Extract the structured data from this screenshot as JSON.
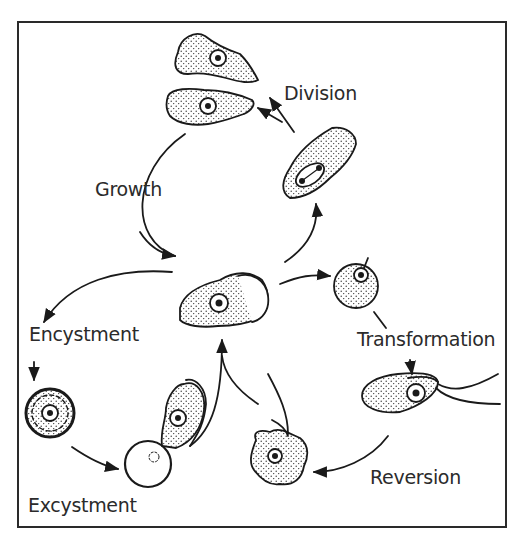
{
  "diagram": {
    "type": "life-cycle",
    "labels": {
      "division": "Division",
      "growth": "Growth",
      "encystment": "Encystment",
      "excystment": "Excystment",
      "transformation": "Transformation",
      "reversion": "Reversion"
    },
    "stages": [
      {
        "id": "trophozoite",
        "description": "central amoeboid trophozoite"
      },
      {
        "id": "dividing-cell",
        "description": "trophozoite with dividing nucleus"
      },
      {
        "id": "daughter-cells",
        "description": "two daughter amoebae"
      },
      {
        "id": "cyst",
        "description": "double-walled cyst"
      },
      {
        "id": "excysting-cell",
        "description": "amoeba emerging from empty cyst"
      },
      {
        "id": "rounded-cell",
        "description": "rounded cell with flagellum emerging"
      },
      {
        "id": "flagellate",
        "description": "flagellate form with two flagella"
      },
      {
        "id": "reverting-amoeba",
        "description": "amoeboid form reverting from flagellate"
      }
    ],
    "colors": {
      "line": "#1a1a1a",
      "text": "#2b2b2b",
      "background": "#ffffff"
    }
  }
}
